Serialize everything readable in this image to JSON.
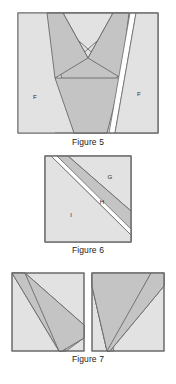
{
  "page": {
    "background_color": "#ffffff",
    "text_color": "#1a1a1a"
  },
  "palette": {
    "light_fill": "#e2e2e2",
    "dark_fill": "#c4c4c4",
    "mid_fill": "#d2d2d2",
    "outline": "#6a6a6a",
    "gap_fill": "#ffffff",
    "label_color": "#2b2b2b"
  },
  "figures": [
    {
      "id": "figure5",
      "caption": "Figure 5",
      "frame": {
        "width": 140,
        "height": 120
      },
      "description": "Rectangle containing a large dark V/trapezoid with an X crossing near the top, flanked by two light regions labelled F, and a narrow white diagonal slit toward the right edge.",
      "labels": [
        {
          "text": "F",
          "x": 18,
          "y": 85
        },
        {
          "text": "F",
          "x": 122,
          "y": 82
        }
      ]
    },
    {
      "id": "figure6",
      "caption": "Figure 6",
      "frame": {
        "width": 86,
        "height": 86
      },
      "description": "Square divided by parallel diagonals: light lower-left region I, a white diagonal slit, a dark band H, and a light upper-right triangle G.",
      "labels": [
        {
          "text": "G",
          "x": 66,
          "y": 22
        },
        {
          "text": "H",
          "x": 58,
          "y": 47
        },
        {
          "text": "I",
          "x": 27,
          "y": 60
        }
      ]
    },
    {
      "id": "figure7",
      "caption": "Figure 7",
      "frame": {
        "width": 152,
        "height": 78
      },
      "description": "Two side-by-side rectangles, each containing a dark V shaped chevron meeting at the bottom.",
      "panels": [
        {
          "id": "figure7-left",
          "width": 72,
          "height": 78
        },
        {
          "id": "figure7-right",
          "width": 72,
          "height": 78
        }
      ],
      "labels": []
    }
  ]
}
